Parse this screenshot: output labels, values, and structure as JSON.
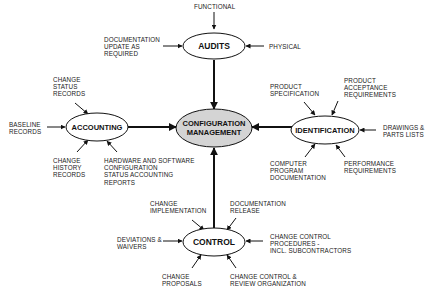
{
  "diagram": {
    "center": {
      "line1": "CONFIGURATION",
      "line2": "MANAGEMENT",
      "fill": "#d4d4d4"
    },
    "nodes": {
      "audits": "AUDITS",
      "accounting": "ACCOUNTING",
      "identification": "IDENTIFICATION",
      "control": "CONTROL"
    },
    "labels": {
      "functional": "FUNCTIONAL",
      "documentation_update": "DOCUMENTATION\nUPDATE AS\nREQUIRED",
      "physical": "PHYSICAL",
      "change_status_records": "CHANGE\nSTATUS\nRECORDS",
      "baseline_records": "BASELINE\nRECORDS",
      "change_history_records": "CHANGE\nHISTORY\nRECORDS",
      "hw_sw_reports": "HARDWARE AND SOFTWARE\nCONFIGURATION\nSTATUS ACCOUNTING\nREPORTS",
      "product_specification": "PRODUCT\nSPECIFICATION",
      "product_acceptance": "PRODUCT\nACCEPTANCE\nREQUIREMENTS",
      "drawings_parts": "DRAWINGS &\nPARTS LISTS",
      "computer_program_doc": "COMPUTER\nPROGRAM\nDOCUMENTATION",
      "performance_requirements": "PERFORMANCE\nREQUIREMENTS",
      "change_implementation": "CHANGE\nIMPLEMENTATION",
      "documentation_release": "DOCUMENTATION\nRELEASE",
      "deviations_waivers": "DEVIATIONS &\nWAIVERS",
      "change_control_procedures": "CHANGE CONTROL\nPROCEDURES -\nINCL. SUBCONTRACTORS",
      "change_proposals": "CHANGE\nPROPOSALS",
      "change_control_review": "CHANGE CONTROL &\nREVIEW ORGANIZATION"
    }
  }
}
